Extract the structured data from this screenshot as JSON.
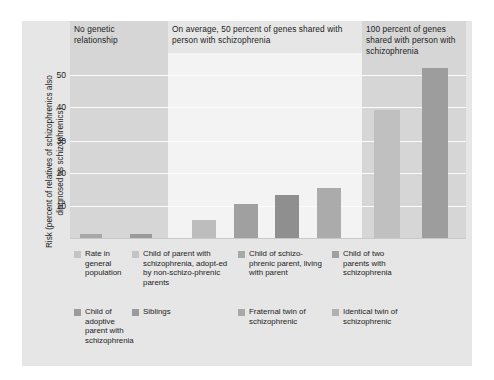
{
  "figure": {
    "background": "#ffffff",
    "panel_color": "#e6e6e6"
  },
  "axis": {
    "y_title": "Risk (percent of relatives of schizophrenics also diagnosed as schizophrenics)",
    "ticks": [
      "50",
      "40",
      "30",
      "20",
      "10"
    ]
  },
  "columns": [
    {
      "id": "no-genetic",
      "title": "No genetic relationship",
      "band_color": "#d6d6d6"
    },
    {
      "id": "fifty-percent",
      "title": "On average, 50 percent of genes shared with person with schizophrenia",
      "band_color": "#f3f3f3"
    },
    {
      "id": "hundred-percent",
      "title": "100 percent of genes shared with person with schizophrenia",
      "band_color": "#d6d6d6"
    }
  ],
  "legend": {
    "row1": [
      {
        "label": "Rate in general population",
        "color": "#c4c4c4"
      },
      {
        "label": "Child of parent with schizophrenia, adopt-ed by non-schizo-phrenic parents",
        "color": "#c4c4c4"
      },
      {
        "label": "Child of schizo-phrenic parent, living with parent",
        "color": "#a8a8a8"
      },
      {
        "label": "Child of two parents with schizophrenia",
        "color": "#a0a0a0"
      }
    ],
    "row2": [
      {
        "label": "Child of adoptive parent with schizophrenia",
        "color": "#9b9b9b"
      },
      {
        "label": "Siblings",
        "color": "#9b9b9b"
      },
      {
        "label": "Fraternal twin of schizophrenic",
        "color": "#a8a8a8"
      },
      {
        "label": "Identical twin of schizophrenic",
        "color": "#b0b0b0"
      }
    ]
  },
  "chart_data": {
    "type": "bar",
    "title": "",
    "xlabel": "",
    "ylabel": "Risk (percent of relatives of schizophrenics also diagnosed as schizophrenics)",
    "ylim": [
      0,
      55
    ],
    "yticks": [
      10,
      20,
      30,
      40,
      50
    ],
    "grid": true,
    "legend_position": "below",
    "group_labels": [
      "No genetic relationship",
      "On average, 50 percent of genes shared with person with schizophrenia",
      "100 percent of genes shared with person with schizophrenia"
    ],
    "categories": [
      "Rate in general population",
      "Child of adoptive parent with schizophrenia",
      "Child of parent with schizophrenia, adopted by non-schizophrenic parents",
      "Siblings",
      "Child of schizophrenic parent, living with parent",
      "Fraternal twin of schizophrenic",
      "Child of two parents with schizophrenia",
      "Identical twin of schizophrenic"
    ],
    "values": [
      1,
      1,
      5,
      9.5,
      12,
      14,
      36,
      48
    ],
    "group_of": [
      0,
      0,
      1,
      1,
      1,
      1,
      2,
      2
    ],
    "colors": [
      "#a7a7a7",
      "#9a9a9a",
      "#bdbdbd",
      "#a0a0a0",
      "#8f8f8f",
      "#ababab",
      "#c0c0c0",
      "#9d9d9d"
    ]
  }
}
